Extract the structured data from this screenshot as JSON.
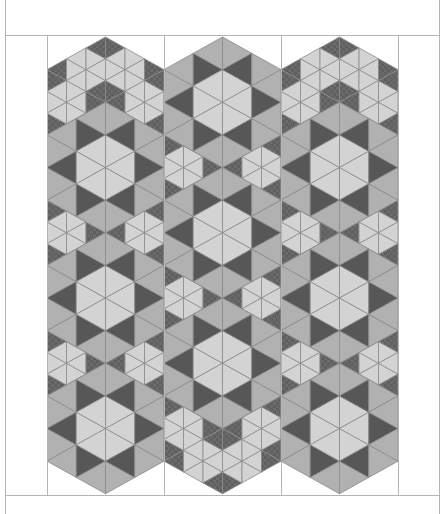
{
  "title": "",
  "palette": {
    "background": "#ffffff",
    "frame_line": "#b4b4b4",
    "seam_line": "#8a8a8a",
    "light": "#d3d3d3",
    "medium": "#b1b1b1",
    "dark": "#575757",
    "print_dark": "#6b6b6b",
    "print_dot": "#4a4a4a"
  },
  "layout": {
    "columns": 3,
    "column_sequences": [
      [
        "cluster",
        "star",
        "cluster",
        "star",
        "cluster",
        "star"
      ],
      [
        "star",
        "cluster",
        "star",
        "cluster",
        "star",
        "cluster"
      ],
      [
        "cluster",
        "star",
        "cluster",
        "star",
        "cluster",
        "star"
      ]
    ]
  },
  "blocks": {
    "star": {
      "name": "Star hexagon",
      "pieces": [
        {
          "role": "center",
          "count": 6,
          "color": "light"
        },
        {
          "role": "star-points",
          "count": 6,
          "color": "dark"
        },
        {
          "role": "background",
          "count": 12,
          "color": "medium"
        }
      ]
    },
    "cluster": {
      "name": "Hexagon cluster",
      "pieces": [
        {
          "role": "center-hex",
          "count": 6,
          "color": "print_dark"
        },
        {
          "role": "ring-hexes",
          "count": 36,
          "color": "light"
        },
        {
          "role": "corner-diamonds",
          "count": 12,
          "color": "print_dark"
        }
      ]
    }
  }
}
